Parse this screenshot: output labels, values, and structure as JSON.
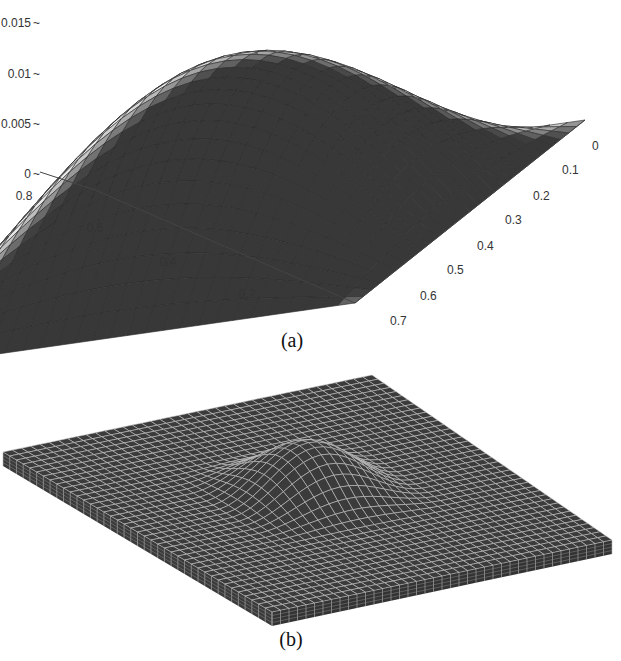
{
  "figure": {
    "panel_a": {
      "caption": "(a)"
    },
    "panel_b": {
      "caption": "(b)"
    }
  },
  "chart_data": [
    {
      "type": "surface",
      "panel": "(a)",
      "title": "",
      "description": "3D shaded mesh surface of a single smooth dome (bubble function) over a rectangular domain; maximum at the center, zero on the boundary",
      "zlabel": "",
      "z_ticks": [
        "0",
        "0.005",
        "0.01",
        "0.015"
      ],
      "zlim": [
        0,
        0.016
      ],
      "x_ticks": [
        "0.2",
        "0.4",
        "0.6",
        "0.8"
      ],
      "xlim": [
        0,
        0.8
      ],
      "y_ticks": [
        "0",
        "0.1",
        "0.2",
        "0.3",
        "0.4",
        "0.5",
        "0.6",
        "0.7"
      ],
      "ylim": [
        0,
        0.7
      ],
      "peak": {
        "x": 0.4,
        "y": 0.35,
        "z": 0.016
      },
      "grid": true,
      "colormap": "grayscale shaded"
    },
    {
      "type": "mesh",
      "panel": "(b)",
      "title": "",
      "description": "3D finite element wireframe mesh of a thin plate with a raised dome-shaped bulge in the central region",
      "grid": true
    }
  ]
}
